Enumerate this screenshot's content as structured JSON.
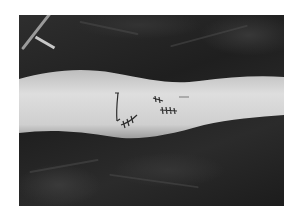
{
  "image": {
    "description": "Grayscale clinical photograph of a lower leg with sutured surgical incisions, lying on dark surgical drapes",
    "colors": {
      "background": "#ffffff",
      "drape": "#2a2a2a",
      "skin": "#d0d0d0",
      "sutures": "#303030"
    }
  }
}
